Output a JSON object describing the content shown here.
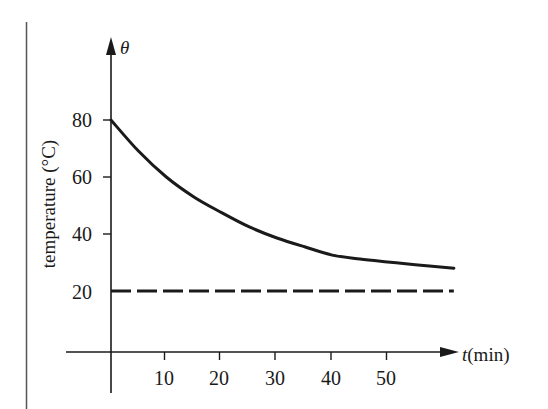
{
  "chart_data": {
    "type": "line",
    "title": "",
    "xlabel": "t(min)",
    "xlabel_var": "t",
    "xlabel_unit": "(min)",
    "ylabel": "temperature (°C)",
    "y_axis_symbol": "θ",
    "x_ticks": [
      10,
      20,
      30,
      40,
      50
    ],
    "y_ticks": [
      20,
      40,
      60,
      80
    ],
    "xlim": [
      0,
      62
    ],
    "ylim": [
      -1,
      110
    ],
    "grid": false,
    "legend": null,
    "series": [
      {
        "name": "cooling curve",
        "style": "solid",
        "x": [
          0,
          5,
          10,
          15,
          20,
          25,
          30,
          35,
          40,
          45,
          50,
          55,
          62
        ],
        "y": [
          80,
          69,
          60,
          53,
          47.5,
          42.5,
          38.6,
          35.5,
          32.6,
          31.2,
          30.2,
          29.2,
          28
        ]
      },
      {
        "name": "room temperature asymptote",
        "style": "dashed",
        "x": [
          0,
          62
        ],
        "y": [
          20,
          20
        ]
      }
    ]
  },
  "labels": {
    "theta": "θ",
    "t": "t",
    "t_unit": "(min)",
    "ylabel": "temperature (°C)",
    "xticks": [
      "10",
      "20",
      "30",
      "40",
      "50"
    ],
    "yticks": [
      "20",
      "40",
      "60",
      "80"
    ]
  },
  "colors": {
    "ink": "#1a1a1a",
    "background": "#ffffff"
  }
}
